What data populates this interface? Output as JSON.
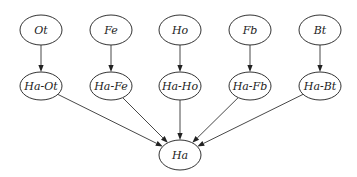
{
  "diagram": {
    "type": "directed-graph",
    "nodes": [
      {
        "id": "Ot",
        "label": "Ot",
        "x": 41,
        "y": 30,
        "rx": 21,
        "ry": 15
      },
      {
        "id": "Fe",
        "label": "Fe",
        "x": 111,
        "y": 30,
        "rx": 21,
        "ry": 15
      },
      {
        "id": "Ho",
        "label": "Ho",
        "x": 180,
        "y": 30,
        "rx": 21,
        "ry": 15
      },
      {
        "id": "Fb",
        "label": "Fb",
        "x": 250,
        "y": 30,
        "rx": 21,
        "ry": 15
      },
      {
        "id": "Bt",
        "label": "Bt",
        "x": 320,
        "y": 30,
        "rx": 21,
        "ry": 15
      },
      {
        "id": "Ha-Ot",
        "label": "Ha-Ot",
        "x": 41,
        "y": 86,
        "rx": 21,
        "ry": 14
      },
      {
        "id": "Ha-Fe",
        "label": "Ha-Fe",
        "x": 111,
        "y": 86,
        "rx": 21,
        "ry": 14
      },
      {
        "id": "Ha-Ho",
        "label": "Ha-Ho",
        "x": 180,
        "y": 86,
        "rx": 21,
        "ry": 14
      },
      {
        "id": "Ha-Fb",
        "label": "Ha-Fb",
        "x": 250,
        "y": 86,
        "rx": 21,
        "ry": 14
      },
      {
        "id": "Ha-Bt",
        "label": "Ha-Bt",
        "x": 320,
        "y": 86,
        "rx": 21,
        "ry": 14
      },
      {
        "id": "Ha",
        "label": "Ha",
        "x": 180,
        "y": 155,
        "rx": 21,
        "ry": 15
      }
    ],
    "edges": [
      {
        "from": "Ot",
        "to": "Ha-Ot"
      },
      {
        "from": "Fe",
        "to": "Ha-Fe"
      },
      {
        "from": "Ho",
        "to": "Ha-Ho"
      },
      {
        "from": "Fb",
        "to": "Ha-Fb"
      },
      {
        "from": "Bt",
        "to": "Ha-Bt"
      },
      {
        "from": "Ha-Ot",
        "to": "Ha"
      },
      {
        "from": "Ha-Fe",
        "to": "Ha"
      },
      {
        "from": "Ha-Ho",
        "to": "Ha"
      },
      {
        "from": "Ha-Fb",
        "to": "Ha"
      },
      {
        "from": "Ha-Bt",
        "to": "Ha"
      }
    ]
  }
}
